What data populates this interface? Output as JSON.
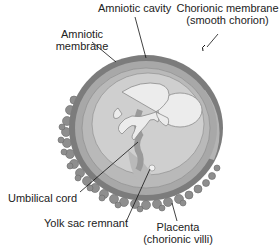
{
  "diagram": {
    "colors": {
      "chorion_outer": "#7c7c7c",
      "chorion_band": "#a8a8a8",
      "amnion_band": "#b9b9b9",
      "amniotic_cavity": "#cfcfcf",
      "fetus": "#ececec",
      "villi": "#8e8e8e",
      "label_text": "#222222",
      "leader_line": "#111111"
    },
    "labels": {
      "amniotic_cavity": "Amniotic cavity",
      "chorionic_membrane_line1": "Chorionic membrane",
      "chorionic_membrane_line2": "(smooth chorion)",
      "amniotic_membrane_line1": "Amniotic",
      "amniotic_membrane_line2": "membrane",
      "umbilical_cord": "Umbilical cord",
      "yolk_sac_remnant": "Yolk sac remnant",
      "placenta_line1": "Placenta",
      "placenta_line2": "(chorionic villi)"
    }
  }
}
